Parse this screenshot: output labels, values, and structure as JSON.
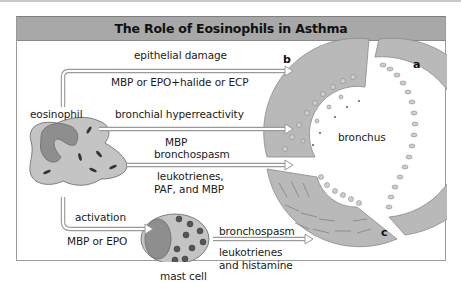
{
  "title": "The Role of Eosinophils in Asthma",
  "cells": {
    "eosinophil": "eosinophil",
    "mast_cell": "mast cell",
    "bronchus": "bronchus"
  },
  "pathways": [
    {
      "effect": "epithelial damage",
      "mediators": "MBP or EPO+halide or ECP",
      "target_panel": "b"
    },
    {
      "effect": "bronchial hyperreactivity",
      "mediators": "MBP",
      "target_panel": "bronchus"
    },
    {
      "effect": "bronchospasm",
      "mediators_line1": "leukotrienes,",
      "mediators_line2": "PAF, and MBP",
      "target_panel": "c"
    },
    {
      "effect": "activation",
      "mediators": "MBP or EPO",
      "target": "mast cell"
    },
    {
      "effect": "bronchospasm",
      "mediators_line1": "leukotrienes",
      "mediators_line2": "and histamine",
      "target_panel": "c"
    }
  ],
  "panels": [
    "a",
    "b",
    "c"
  ],
  "colors": {
    "title_bar": "#a8a8a8",
    "cell_fill": "#c4c4c4",
    "nucleus_fill": "#8e8e8e",
    "tissue_fill": "#b9b9b9",
    "arrow_outline": "#9a9a9a"
  }
}
